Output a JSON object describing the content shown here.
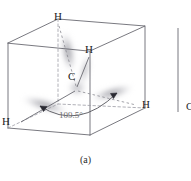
{
  "figure": {
    "caption": "(a)",
    "angle_label": "109.5°",
    "center_atom": "C",
    "hydrogen_top": "H",
    "hydrogen_upper_right": "H",
    "hydrogen_left": "H",
    "hydrogen_right": "H",
    "partial_next_figure_atom": "C",
    "colors": {
      "cube_edge": "#6a6a72",
      "dashed_edge": "#8a8a92",
      "orbital_lobe": "#9a9aa2",
      "text": "#1c1c1c",
      "angle_text": "#6d6d6d",
      "background": "#ffffff"
    },
    "geometry": {
      "cube_front_top_left": [
        8,
        43
      ],
      "cube_front_top_right": [
        90,
        51
      ],
      "cube_back_top_left": [
        58,
        19
      ],
      "cube_back_top_right": [
        145,
        26
      ],
      "cube_front_bottom_left": [
        8,
        128
      ],
      "cube_front_bottom_right": [
        90,
        135
      ],
      "cube_back_bottom_left": [
        58,
        104
      ],
      "cube_back_bottom_right": [
        145,
        108
      ],
      "carbon_center": [
        76,
        90
      ],
      "hydrogen_positions": [
        [
          58,
          19
        ],
        [
          90,
          51
        ],
        [
          14,
          123
        ],
        [
          139,
          106
        ]
      ]
    }
  }
}
